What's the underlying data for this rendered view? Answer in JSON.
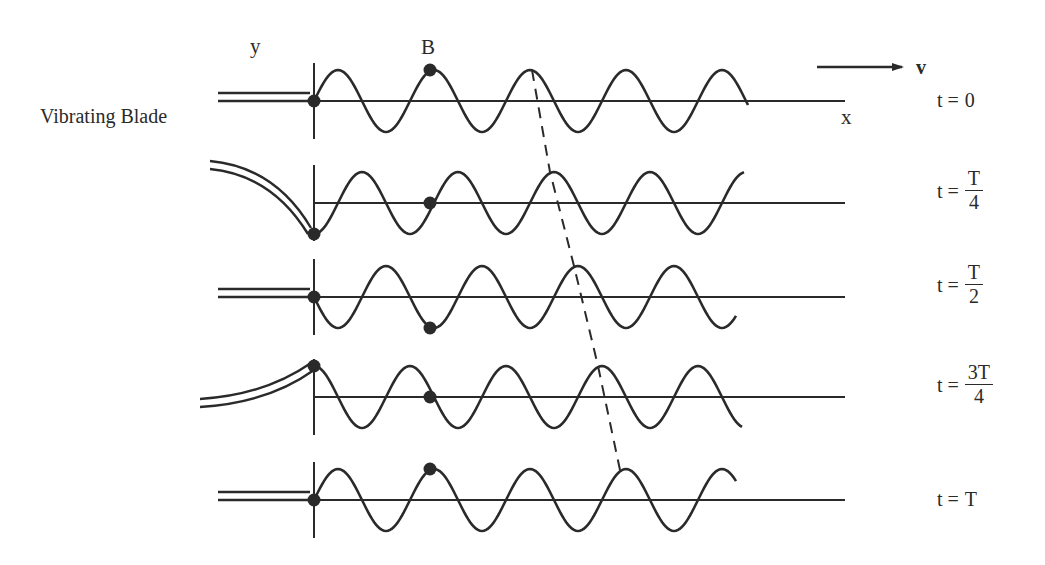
{
  "labels": {
    "y_axis": "y",
    "x_axis": "x",
    "point": "B",
    "velocity": "v",
    "blade": "Vibrating Blade"
  },
  "rows": [
    {
      "t_prefix": "t =",
      "t_plain": "0",
      "num": "",
      "den": "",
      "axis_y": 101,
      "blade": "straight",
      "source_phase": "zero"
    },
    {
      "t_prefix": "t =",
      "t_plain": "",
      "num": "T",
      "den": "4",
      "axis_y": 203,
      "blade": "bent-down",
      "source_phase": "trough"
    },
    {
      "t_prefix": "t =",
      "t_plain": "",
      "num": "T",
      "den": "2",
      "axis_y": 297,
      "blade": "straight",
      "source_phase": "zero"
    },
    {
      "t_prefix": "t =",
      "t_plain": "",
      "num": "3T",
      "den": "4",
      "axis_y": 397,
      "blade": "bent-up",
      "source_phase": "crest"
    },
    {
      "t_prefix": "t =",
      "t_plain": "T",
      "num": "",
      "den": "",
      "axis_y": 500,
      "blade": "straight",
      "source_phase": "zero"
    }
  ],
  "wave": {
    "origin_x": 314,
    "wavelength_px": 96,
    "amplitude_px": 31,
    "point_B_x": 430,
    "stroke_color": "#2a2a2a"
  },
  "point_B_states": [
    "crest",
    "equilibrium",
    "trough",
    "equilibrium",
    "crest"
  ],
  "dashed_crest_track": [
    [
      532,
      70
    ],
    [
      550,
      172
    ],
    [
      574,
      266
    ],
    [
      598,
      366
    ],
    [
      620,
      470
    ]
  ]
}
